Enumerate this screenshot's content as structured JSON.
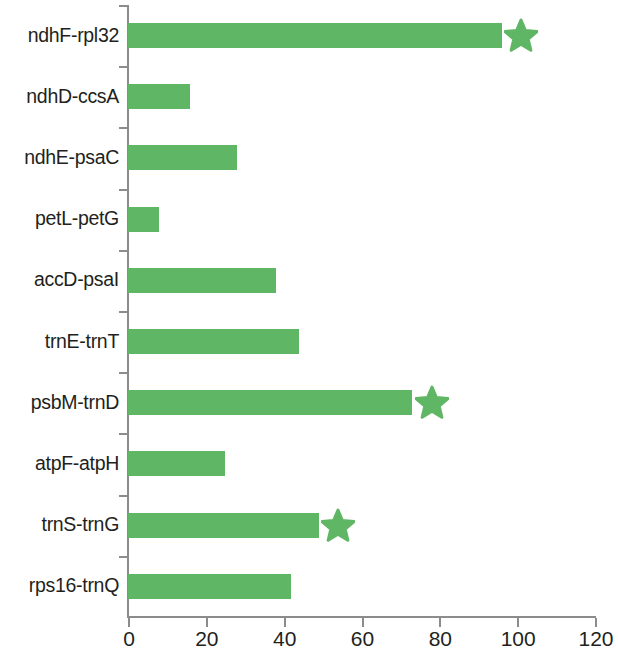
{
  "chart_data": {
    "type": "bar",
    "orientation": "horizontal",
    "title": "",
    "subtitle": "",
    "xlabel": "",
    "ylabel": "",
    "xlim": [
      0,
      120
    ],
    "ylim": null,
    "grid": false,
    "legend": null,
    "xticks": [
      0,
      20,
      40,
      60,
      80,
      100,
      120
    ],
    "xtick_labels": [
      "0",
      "20",
      "40",
      "60",
      "80",
      "100",
      "120"
    ],
    "bar_color": "#5fb664",
    "axis_color": "#8c8c8c",
    "text_color": "#231f20",
    "categories": [
      "ndhF-rpl32",
      "ndhD-ccsA",
      "ndhE-psaC",
      "petL-petG",
      "accD-psaI",
      "trnE-trnT",
      "psbM-trnD",
      "atpF-atpH",
      "trnS-trnG",
      "rps16-trnQ"
    ],
    "values": [
      96,
      16,
      28,
      8,
      38,
      44,
      73,
      25,
      49,
      42
    ],
    "annotations": [
      {
        "category": "ndhF-rpl32",
        "marker": "star",
        "x": 101
      },
      {
        "category": "psbM-trnD",
        "marker": "star",
        "x": 78
      },
      {
        "category": "trnS-trnG",
        "marker": "star",
        "x": 54
      }
    ]
  }
}
